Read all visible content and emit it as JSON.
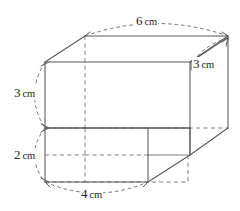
{
  "figure": {
    "units": "cm",
    "colors": {
      "visible_edge": "#58595b",
      "hidden_edge": "#808285",
      "dimension_arc": "#6d6e71",
      "label_text": "#231f20",
      "background": "#ffffff"
    },
    "dimensions": [
      {
        "id": "top-width",
        "value": "6",
        "unit": "cm",
        "label": "6 cm",
        "position": "top",
        "measures": "upper prism back top width"
      },
      {
        "id": "right-depth",
        "value": "3",
        "unit": "cm",
        "label": "3 cm",
        "position": "top-right",
        "measures": "depth of the solid"
      },
      {
        "id": "upper-height",
        "value": "3",
        "unit": "cm",
        "label": "3 cm",
        "position": "left-upper",
        "measures": "height of upper prism"
      },
      {
        "id": "lower-height",
        "value": "2",
        "unit": "cm",
        "label": "2 cm",
        "position": "left-lower",
        "measures": "height of lower prism"
      },
      {
        "id": "bottom-width",
        "value": "4",
        "unit": "cm",
        "label": "4 cm",
        "position": "bottom",
        "measures": "lower prism front bottom width"
      }
    ],
    "labels": {
      "top_width_num": "6",
      "top_width_unit": "cm",
      "right_depth_num": "3",
      "right_depth_unit": "cm",
      "upper_height_num": "3",
      "upper_height_unit": "cm",
      "lower_height_num": "2",
      "lower_height_unit": "cm",
      "bottom_width_num": "4",
      "bottom_width_unit": "cm"
    }
  }
}
